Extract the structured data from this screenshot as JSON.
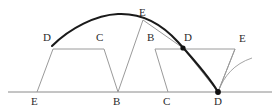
{
  "figure": {
    "background_color": "#ffffff",
    "ink_color": "#2b2b2b",
    "thin_line_color": "#8a8a8a",
    "thick_curve_color": "#1a1a1a",
    "baseline": {
      "y": 92,
      "x_start": 8,
      "x_end": 272,
      "color": "#8a8a8a"
    },
    "labels": [
      {
        "id": "label-bottom-e",
        "text": "E",
        "x": 31,
        "y": 96
      },
      {
        "id": "label-bottom-b",
        "text": "B",
        "x": 113,
        "y": 96
      },
      {
        "id": "label-bottom-c",
        "text": "C",
        "x": 163,
        "y": 96
      },
      {
        "id": "label-bottom-d",
        "text": "D",
        "x": 214,
        "y": 96
      },
      {
        "id": "label-left-d",
        "text": "D",
        "x": 43,
        "y": 32
      },
      {
        "id": "label-left-c",
        "text": "C",
        "x": 96,
        "y": 32
      },
      {
        "id": "label-top-e",
        "text": "E",
        "x": 139,
        "y": 7
      },
      {
        "id": "label-right-b",
        "text": "B",
        "x": 147,
        "y": 32
      },
      {
        "id": "label-right-d",
        "text": "D",
        "x": 184,
        "y": 32
      },
      {
        "id": "label-right-e",
        "text": "E",
        "x": 239,
        "y": 33
      }
    ],
    "points": [
      {
        "id": "point-d-upper",
        "x": 183,
        "y": 48,
        "r": 2.6,
        "filled": true
      },
      {
        "id": "point-d-baseline",
        "x": 218,
        "y": 92,
        "r": 2.9,
        "filled": true
      }
    ],
    "left_trapezoid": {
      "top_left": {
        "x": 53,
        "y": 49
      },
      "top_right": {
        "x": 104,
        "y": 49
      },
      "bottom_left": {
        "x": 37,
        "y": 92
      },
      "bottom_right": {
        "x": 118,
        "y": 92
      }
    },
    "right_trapezoid": {
      "top_left": {
        "x": 155,
        "y": 49
      },
      "top_right": {
        "x": 235,
        "y": 49
      },
      "bottom_left": {
        "x": 168,
        "y": 92
      },
      "bottom_right": {
        "x": 218,
        "y": 92
      }
    },
    "construction_lines": [
      {
        "id": "line-top-e-to-b",
        "x1": 143,
        "y1": 20,
        "x2": 118,
        "y2": 92
      },
      {
        "id": "line-top-e-to-d-upper",
        "x1": 143,
        "y1": 20,
        "x2": 183,
        "y2": 48
      },
      {
        "id": "line-b-right-to-d-upper",
        "x1": 155,
        "y1": 49,
        "x2": 183,
        "y2": 48
      },
      {
        "id": "line-d-upper-to-d-baseline",
        "x1": 183,
        "y1": 48,
        "x2": 218,
        "y2": 92
      },
      {
        "id": "line-right-e-to-d-baseline",
        "x1": 235,
        "y1": 49,
        "x2": 218,
        "y2": 92
      }
    ],
    "thick_curve": {
      "id": "cycloid-arc",
      "stroke_width": 2.1,
      "start": {
        "x": 52,
        "y": 46
      },
      "apex": {
        "x": 118,
        "y": 14
      },
      "end": {
        "x": 218,
        "y": 92
      },
      "path": "M 52 46 C 70 28, 96 15, 118 14 C 140 13, 160 22, 178 42 C 196 62, 210 78, 218 92"
    },
    "tail_curve": {
      "id": "tail-arc",
      "path": "M 218 92 C 224 76, 234 64, 252 58",
      "stroke_width": 0.8
    }
  }
}
